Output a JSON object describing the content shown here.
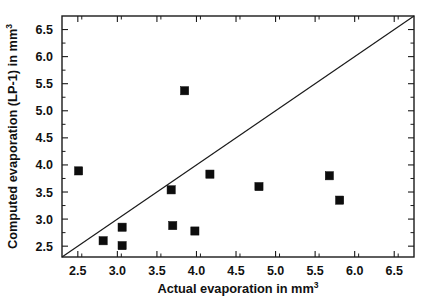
{
  "chart_data": {
    "type": "scatter",
    "title": "",
    "xlabel": "Actual evaporation in mm",
    "xlabel_sup": "3",
    "ylabel": "Computed evaporation (LP-1) in mm",
    "ylabel_sup": "3",
    "xlim": [
      2.3,
      6.75
    ],
    "ylim": [
      2.3,
      6.75
    ],
    "xticks": [
      2.5,
      3.0,
      3.5,
      4.0,
      4.5,
      5.0,
      5.5,
      6.0,
      6.5
    ],
    "yticks": [
      2.5,
      3.0,
      3.5,
      4.0,
      4.5,
      5.0,
      5.5,
      6.0,
      6.5
    ],
    "xticklabels": [
      "2.5",
      "3.0",
      "3.5",
      "4.0",
      "4.5",
      "5.0",
      "5.5",
      "6.0",
      "6.5"
    ],
    "yticklabels": [
      "2.5",
      "3.0",
      "3.5",
      "4.0",
      "4.5",
      "5.0",
      "5.5",
      "6.0",
      "6.5"
    ],
    "grid": false,
    "legend": false,
    "marker_style": "filled-square",
    "marker_color": "#0d0d0d",
    "series": [
      {
        "name": "Computed vs actual evaporation",
        "points": [
          {
            "x": 2.51,
            "y": 3.89
          },
          {
            "x": 2.82,
            "y": 2.6
          },
          {
            "x": 3.06,
            "y": 2.85
          },
          {
            "x": 3.06,
            "y": 2.51
          },
          {
            "x": 3.68,
            "y": 3.54
          },
          {
            "x": 3.7,
            "y": 2.88
          },
          {
            "x": 3.85,
            "y": 5.37
          },
          {
            "x": 3.98,
            "y": 2.78
          },
          {
            "x": 4.17,
            "y": 3.83
          },
          {
            "x": 4.79,
            "y": 3.6
          },
          {
            "x": 5.68,
            "y": 3.8
          },
          {
            "x": 5.81,
            "y": 3.35
          }
        ]
      }
    ],
    "reference_line": {
      "name": "1:1 identity line",
      "x0": 2.3,
      "y0": 2.3,
      "x1": 6.75,
      "y1": 6.75
    }
  }
}
